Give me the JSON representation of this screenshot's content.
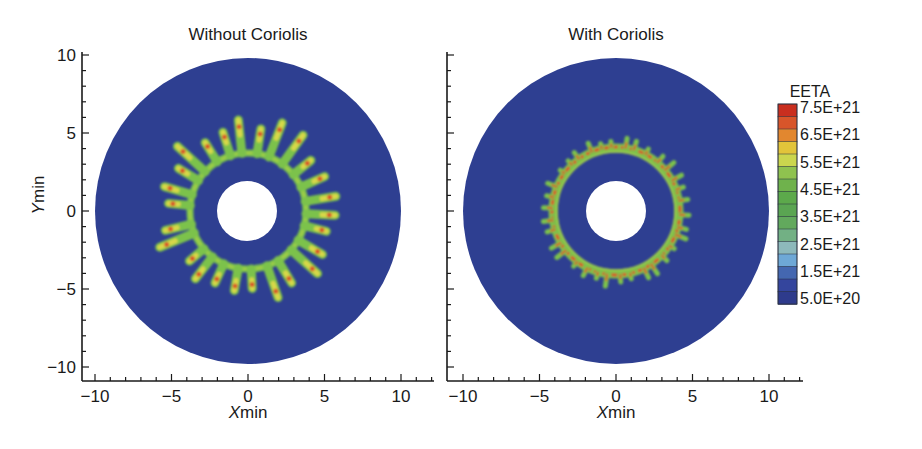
{
  "chart_data": [
    {
      "type": "heatmap",
      "title": "Without Coriolis",
      "xlabel": "Xmin",
      "ylabel": "Ymin",
      "xlim": [
        -11,
        12.2
      ],
      "ylim": [
        -11,
        10.3
      ],
      "xticks": [
        -10,
        -5,
        0,
        5,
        10
      ],
      "yticks": [
        -10,
        -5,
        0,
        5,
        10
      ],
      "grid": false,
      "domain": {
        "shape": "annulus",
        "inner_radius": 2,
        "outer_radius": 10
      },
      "feature": {
        "description": "Fingering ring with long radial fingers",
        "ring_radius": 3.8,
        "finger_max_radius": 6.0,
        "finger_count": 26
      }
    },
    {
      "type": "heatmap",
      "title": "With Coriolis",
      "xlabel": "Xmin",
      "ylabel": "",
      "xlim": [
        -11,
        12.2
      ],
      "ylim": [
        -11,
        10.3
      ],
      "xticks": [
        -10,
        -5,
        0,
        5,
        10
      ],
      "yticks": [
        -10,
        -5,
        0,
        5,
        10
      ],
      "grid": false,
      "domain": {
        "shape": "annulus",
        "inner_radius": 2,
        "outer_radius": 10
      },
      "feature": {
        "description": "Thin ring with short wavy fingers",
        "ring_radius": 3.8,
        "finger_max_radius": 4.7,
        "finger_count": 34
      }
    }
  ],
  "plots": {
    "left": {
      "title": "Without Coriolis",
      "xlabel_italic": "X",
      "xlabel_rest": "min",
      "ylabel_italic": "Y",
      "ylabel_rest": "min",
      "xtick_labels": [
        "−10",
        "−5",
        "0",
        "5",
        "10"
      ],
      "ytick_labels": [
        "10",
        "5",
        "0",
        "−5",
        "−10"
      ]
    },
    "right": {
      "title": "With Coriolis",
      "xlabel_italic": "X",
      "xlabel_rest": "min",
      "xtick_labels": [
        "−10",
        "−5",
        "0",
        "5",
        "10"
      ]
    }
  },
  "legend": {
    "title": "EETA",
    "labels": [
      "7.5E+21",
      "6.5E+21",
      "5.5E+21",
      "4.5E+21",
      "3.5E+21",
      "2.5E+21",
      "1.5E+21",
      "5.0E+20"
    ],
    "colors": [
      "#c92e1f",
      "#d8552a",
      "#e2872f",
      "#e2c43a",
      "#cbd64e",
      "#8fc24f",
      "#6fb24c",
      "#5ca94b",
      "#5aa552",
      "#62a95d",
      "#72b084",
      "#8db9bb",
      "#6ea8d6",
      "#4467b0",
      "#34459d",
      "#2e3b8c"
    ]
  },
  "colors": {
    "disk": "#2e3f91",
    "hole": "#ffffff",
    "finger_edge": "#7cc24c",
    "finger_mid": "#d8d848",
    "finger_core": "#d8552a",
    "axis": "#1a1a1a"
  }
}
